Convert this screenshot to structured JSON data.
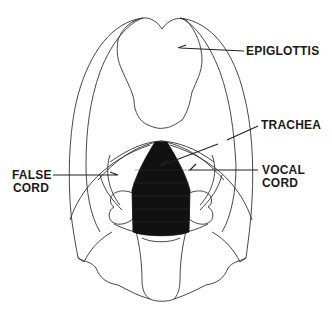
{
  "diagram": {
    "colors": {
      "line": "#333333",
      "fill_dark": "#111111",
      "background": "#ffffff"
    },
    "labels": [
      {
        "id": "epiglottis",
        "text": "EPIGLOTTIS"
      },
      {
        "id": "trachea",
        "text": "TRACHEA"
      },
      {
        "id": "vocal_cord_line1",
        "text": "VOCAL"
      },
      {
        "id": "vocal_cord_line2",
        "text": "CORD"
      },
      {
        "id": "false_cord_line1",
        "text": "FALSE"
      },
      {
        "id": "false_cord_line2",
        "text": "CORD"
      }
    ]
  }
}
